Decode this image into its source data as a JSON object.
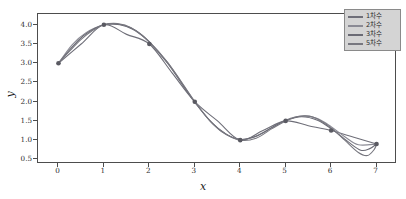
{
  "chart_data": {
    "type": "line",
    "title": "",
    "xlabel": "x",
    "ylabel": "y",
    "xlim": [
      -0.45,
      7.45
    ],
    "ylim": [
      0.38,
      4.28
    ],
    "grid": false,
    "legend_position": "upper right",
    "xticks": [
      "0",
      "1",
      "2",
      "3",
      "4",
      "5",
      "6",
      "7"
    ],
    "xtick_values": [
      0,
      1,
      2,
      3,
      4,
      5,
      6,
      7
    ],
    "yticks": [
      "0.5",
      "1.0",
      "1.5",
      "2.0",
      "2.5",
      "3.0",
      "3.5",
      "4.0"
    ],
    "ytick_values": [
      0.5,
      1.0,
      1.5,
      2.0,
      2.5,
      3.0,
      3.5,
      4.0
    ],
    "scatter_points": {
      "x": [
        0,
        1,
        2,
        3,
        4,
        5,
        6,
        7
      ],
      "y": [
        3.0,
        4.0,
        3.5,
        2.0,
        1.0,
        1.5,
        1.25,
        0.9
      ],
      "marker": "circle",
      "color": "#5a5a62"
    },
    "series": [
      {
        "name": "1차수",
        "degree": 1,
        "color": "#6e6e78",
        "x": [
          0,
          1,
          2,
          3,
          4,
          5,
          6,
          7
        ],
        "values": [
          3.0,
          4.0,
          3.5,
          2.0,
          1.0,
          1.5,
          1.25,
          0.9
        ]
      },
      {
        "name": "2차수",
        "degree": 2,
        "color": "#8a8a94",
        "x": [
          0,
          1,
          2,
          3,
          4,
          5,
          6,
          7
        ],
        "values": [
          3.0,
          4.0,
          3.5,
          2.0,
          1.0,
          1.5,
          1.25,
          0.9
        ]
      },
      {
        "name": "3차수",
        "degree": 3,
        "color": "#6a6a74",
        "x": [
          0,
          1,
          2,
          3,
          4,
          5,
          6,
          7
        ],
        "values": [
          3.0,
          4.0,
          3.5,
          2.0,
          1.0,
          1.5,
          1.25,
          0.9
        ]
      },
      {
        "name": "5차수",
        "degree": 5,
        "color": "#77777f",
        "x": [
          0,
          1,
          2,
          3,
          4,
          5,
          6,
          7
        ],
        "values": [
          3.0,
          4.0,
          3.5,
          2.0,
          1.0,
          1.5,
          1.25,
          0.9
        ]
      }
    ],
    "curves": [
      {
        "name": "1차수",
        "points": [
          [
            0,
            3.0
          ],
          [
            0.5,
            3.5
          ],
          [
            1,
            4.0
          ],
          [
            1.5,
            3.75
          ],
          [
            2,
            3.5
          ],
          [
            2.5,
            2.75
          ],
          [
            3,
            2.0
          ],
          [
            3.5,
            1.5
          ],
          [
            4,
            1.0
          ],
          [
            4.5,
            1.25
          ],
          [
            5,
            1.5
          ],
          [
            5.5,
            1.375
          ],
          [
            6,
            1.25
          ],
          [
            6.5,
            1.075
          ],
          [
            7,
            0.9
          ]
        ]
      },
      {
        "name": "2차수",
        "points": [
          [
            0,
            3.0
          ],
          [
            0.3,
            3.48
          ],
          [
            0.6,
            3.79
          ],
          [
            1.0,
            4.0
          ],
          [
            1.4,
            4.0
          ],
          [
            1.7,
            3.84
          ],
          [
            2.0,
            3.56
          ],
          [
            2.4,
            3.02
          ],
          [
            2.8,
            2.34
          ],
          [
            3.0,
            1.99
          ],
          [
            3.4,
            1.42
          ],
          [
            3.7,
            1.14
          ],
          [
            4.0,
            1.02
          ],
          [
            4.3,
            1.08
          ],
          [
            4.6,
            1.26
          ],
          [
            5.0,
            1.52
          ],
          [
            5.4,
            1.63
          ],
          [
            5.7,
            1.56
          ],
          [
            6.0,
            1.35
          ],
          [
            6.3,
            1.09
          ],
          [
            6.6,
            0.88
          ],
          [
            7.0,
            0.9
          ]
        ]
      },
      {
        "name": "3차수",
        "points": [
          [
            0,
            3.0
          ],
          [
            0.3,
            3.42
          ],
          [
            0.6,
            3.76
          ],
          [
            1.0,
            4.0
          ],
          [
            1.35,
            4.0
          ],
          [
            1.7,
            3.85
          ],
          [
            2.0,
            3.55
          ],
          [
            2.4,
            3.0
          ],
          [
            2.8,
            2.32
          ],
          [
            3.0,
            1.99
          ],
          [
            3.35,
            1.48
          ],
          [
            3.7,
            1.15
          ],
          [
            4.0,
            1.02
          ],
          [
            4.35,
            1.1
          ],
          [
            4.7,
            1.33
          ],
          [
            5.0,
            1.51
          ],
          [
            5.35,
            1.61
          ],
          [
            5.7,
            1.52
          ],
          [
            6.0,
            1.3
          ],
          [
            6.35,
            0.98
          ],
          [
            6.65,
            0.74
          ],
          [
            6.85,
            0.78
          ],
          [
            7.0,
            0.9
          ]
        ]
      },
      {
        "name": "5차수",
        "points": [
          [
            0,
            3.0
          ],
          [
            0.25,
            3.32
          ],
          [
            0.5,
            3.62
          ],
          [
            0.75,
            3.85
          ],
          [
            1.0,
            4.0
          ],
          [
            1.3,
            4.03
          ],
          [
            1.6,
            3.92
          ],
          [
            2.0,
            3.55
          ],
          [
            2.4,
            3.02
          ],
          [
            2.8,
            2.35
          ],
          [
            3.0,
            2.0
          ],
          [
            3.3,
            1.55
          ],
          [
            3.6,
            1.22
          ],
          [
            4.0,
            1.0
          ],
          [
            4.35,
            1.05
          ],
          [
            4.7,
            1.3
          ],
          [
            5.0,
            1.5
          ],
          [
            5.3,
            1.62
          ],
          [
            5.6,
            1.6
          ],
          [
            6.0,
            1.32
          ],
          [
            6.3,
            1.0
          ],
          [
            6.6,
            0.68
          ],
          [
            6.8,
            0.6
          ],
          [
            6.95,
            0.76
          ],
          [
            7.0,
            0.9
          ]
        ]
      }
    ]
  },
  "legend": {
    "entries": [
      {
        "label": "1차수"
      },
      {
        "label": "2차수"
      },
      {
        "label": "3차수"
      },
      {
        "label": "5차수"
      }
    ]
  },
  "colors": {
    "axis": "#4d4d4d",
    "tick_text": "#2b2b2b",
    "label_text": "#1a1a1a",
    "legend_bg": "#d4d4d4",
    "legend_border": "#8a8a8a",
    "figure_bg": "#ffffff"
  }
}
